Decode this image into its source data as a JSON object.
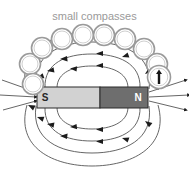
{
  "figure": {
    "caption": "small compasses",
    "caption_color": "#9a9a9a",
    "background_color": "#ffffff",
    "width": 189,
    "height": 176
  },
  "magnet": {
    "south_label": "S",
    "north_label": "N",
    "south_fill": "#d2d2d2",
    "north_fill": "#6e6e6e",
    "outline_color": "#2b2b2b",
    "x": 37,
    "y": 87,
    "width": 111,
    "height": 21
  },
  "field": {
    "line_color": "#555555",
    "arrow_color": "#1c1c1c",
    "direction": "north-to-south"
  },
  "compasses": {
    "ring_color": "#9b9b9b",
    "fill_color": "#ffffff",
    "count": 10,
    "items": [
      {
        "cx": 30,
        "cy": 64,
        "r": 10.5,
        "needle": false
      },
      {
        "cx": 33,
        "cy": 84,
        "r": 10.5,
        "needle": false
      },
      {
        "cx": 42,
        "cy": 48,
        "r": 10.5,
        "needle": false
      },
      {
        "cx": 62,
        "cy": 39,
        "r": 10.5,
        "needle": false
      },
      {
        "cx": 83,
        "cy": 35,
        "r": 10.5,
        "needle": false
      },
      {
        "cx": 104,
        "cy": 35,
        "r": 10.5,
        "needle": false
      },
      {
        "cx": 125,
        "cy": 39,
        "r": 10.5,
        "needle": false
      },
      {
        "cx": 144,
        "cy": 49,
        "r": 10.5,
        "needle": false
      },
      {
        "cx": 157,
        "cy": 64,
        "r": 10.5,
        "needle": false
      },
      {
        "cx": 159,
        "cy": 77,
        "r": 11.5,
        "needle": true
      }
    ]
  }
}
